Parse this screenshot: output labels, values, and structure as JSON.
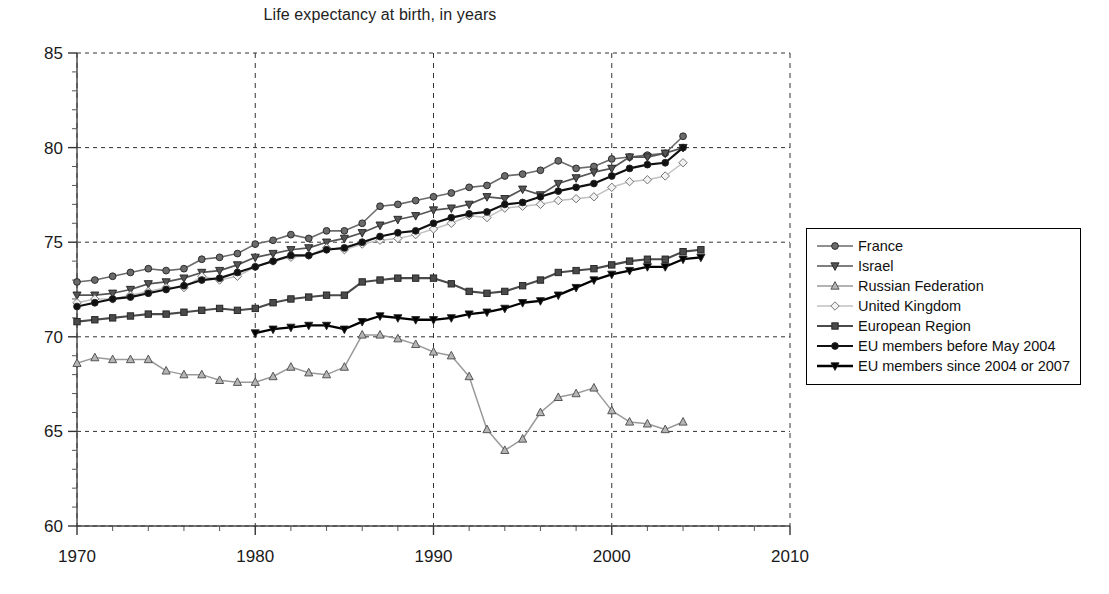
{
  "chart_data": {
    "type": "line",
    "title": "Life expectancy at birth, in years",
    "xlabel": "",
    "ylabel": "",
    "xlim": [
      1970,
      2010
    ],
    "ylim": [
      60,
      85
    ],
    "xticks": [
      1970,
      1980,
      1990,
      2000,
      2010
    ],
    "yticks": [
      60,
      65,
      70,
      75,
      80,
      85
    ],
    "x_minor_tick_step": 2,
    "y_minor_tick_step": 1,
    "grid": "dashed gridlines at major x and y ticks",
    "legend_position": "right, outside plot area, boxed",
    "series": [
      {
        "name": "France",
        "marker": "circle",
        "color": "#6b6b6b",
        "line_width": 1.6,
        "x": [
          1970,
          1971,
          1972,
          1973,
          1974,
          1975,
          1976,
          1977,
          1978,
          1979,
          1980,
          1981,
          1982,
          1983,
          1984,
          1985,
          1986,
          1987,
          1988,
          1989,
          1990,
          1991,
          1992,
          1993,
          1994,
          1995,
          1996,
          1997,
          1998,
          1999,
          2000,
          2001,
          2002,
          2003,
          2004
        ],
        "y": [
          72.9,
          73.0,
          73.2,
          73.4,
          73.6,
          73.5,
          73.6,
          74.1,
          74.2,
          74.4,
          74.9,
          75.1,
          75.4,
          75.2,
          75.6,
          75.6,
          76.0,
          76.9,
          77.0,
          77.2,
          77.4,
          77.6,
          77.9,
          78.0,
          78.5,
          78.6,
          78.8,
          79.3,
          78.9,
          79.0,
          79.4,
          79.5,
          79.6,
          79.7,
          80.6
        ]
      },
      {
        "name": "Israel",
        "marker": "triangle-down",
        "color": "#555555",
        "line_width": 1.7,
        "x": [
          1970,
          1971,
          1972,
          1973,
          1974,
          1975,
          1976,
          1977,
          1978,
          1979,
          1980,
          1981,
          1982,
          1983,
          1984,
          1985,
          1986,
          1987,
          1988,
          1989,
          1990,
          1991,
          1992,
          1993,
          1994,
          1995,
          1996,
          1997,
          1998,
          1999,
          2000,
          2001,
          2002,
          2003,
          2004
        ],
        "y": [
          72.2,
          72.2,
          72.3,
          72.5,
          72.8,
          72.9,
          73.1,
          73.4,
          73.5,
          73.8,
          74.2,
          74.4,
          74.6,
          74.7,
          75.0,
          75.2,
          75.5,
          75.9,
          76.2,
          76.4,
          76.7,
          76.8,
          77.0,
          77.4,
          77.3,
          77.8,
          77.5,
          78.1,
          78.4,
          78.7,
          78.9,
          79.5,
          79.5,
          79.7,
          80.0
        ]
      },
      {
        "name": "Russian Federation",
        "marker": "triangle-up",
        "color": "#9a9a9a",
        "line_width": 1.5,
        "x": [
          1970,
          1971,
          1972,
          1973,
          1974,
          1975,
          1976,
          1977,
          1978,
          1979,
          1980,
          1981,
          1982,
          1983,
          1984,
          1985,
          1986,
          1987,
          1988,
          1989,
          1990,
          1991,
          1992,
          1993,
          1994,
          1995,
          1996,
          1997,
          1998,
          1999,
          2000,
          2001,
          2002,
          2003,
          2004
        ],
        "y": [
          68.6,
          68.9,
          68.8,
          68.8,
          68.8,
          68.2,
          68.0,
          68.0,
          67.7,
          67.6,
          67.6,
          67.9,
          68.4,
          68.1,
          68.0,
          68.4,
          70.1,
          70.1,
          69.9,
          69.6,
          69.2,
          69.0,
          67.9,
          65.1,
          64.0,
          64.6,
          66.0,
          66.8,
          67.0,
          67.3,
          66.1,
          65.5,
          65.4,
          65.1,
          65.5
        ]
      },
      {
        "name": "United Kingdom",
        "marker": "diamond",
        "color": "#c0c0c0",
        "line_width": 1.5,
        "x": [
          1970,
          1971,
          1972,
          1973,
          1974,
          1975,
          1976,
          1977,
          1978,
          1979,
          1980,
          1981,
          1982,
          1983,
          1984,
          1985,
          1986,
          1987,
          1988,
          1989,
          1990,
          1991,
          1992,
          1993,
          1994,
          1995,
          1996,
          1997,
          1998,
          1999,
          2000,
          2001,
          2002,
          2003,
          2004
        ],
        "y": [
          71.8,
          72.0,
          72.0,
          72.2,
          72.4,
          72.6,
          72.6,
          73.2,
          73.0,
          73.2,
          73.7,
          74.0,
          74.2,
          74.3,
          74.7,
          74.6,
          74.9,
          75.1,
          75.2,
          75.4,
          75.7,
          76.0,
          76.4,
          76.3,
          76.8,
          76.9,
          77.0,
          77.2,
          77.3,
          77.4,
          77.9,
          78.2,
          78.3,
          78.5,
          79.2
        ]
      },
      {
        "name": "European Region",
        "marker": "square",
        "color": "#4a4a4a",
        "line_width": 2.1,
        "x": [
          1970,
          1971,
          1972,
          1973,
          1974,
          1975,
          1976,
          1977,
          1978,
          1979,
          1980,
          1981,
          1982,
          1983,
          1984,
          1985,
          1986,
          1987,
          1988,
          1989,
          1990,
          1991,
          1992,
          1993,
          1994,
          1995,
          1996,
          1997,
          1998,
          1999,
          2000,
          2001,
          2002,
          2003,
          2004,
          2005
        ],
        "y": [
          70.8,
          70.9,
          71.0,
          71.1,
          71.2,
          71.2,
          71.3,
          71.4,
          71.5,
          71.4,
          71.5,
          71.8,
          72.0,
          72.1,
          72.2,
          72.2,
          72.9,
          73.0,
          73.1,
          73.1,
          73.1,
          72.8,
          72.4,
          72.3,
          72.4,
          72.7,
          73.0,
          73.4,
          73.5,
          73.6,
          73.8,
          74.0,
          74.1,
          74.1,
          74.5,
          74.6
        ]
      },
      {
        "name": "EU members before May 2004",
        "marker": "circle",
        "color": "#111111",
        "line_width": 2.2,
        "x": [
          1970,
          1971,
          1972,
          1973,
          1974,
          1975,
          1976,
          1977,
          1978,
          1979,
          1980,
          1981,
          1982,
          1983,
          1984,
          1985,
          1986,
          1987,
          1988,
          1989,
          1990,
          1991,
          1992,
          1993,
          1994,
          1995,
          1996,
          1997,
          1998,
          1999,
          2000,
          2001,
          2002,
          2003,
          2004
        ],
        "y": [
          71.6,
          71.8,
          72.0,
          72.1,
          72.3,
          72.5,
          72.7,
          73.0,
          73.1,
          73.4,
          73.7,
          74.0,
          74.3,
          74.3,
          74.6,
          74.7,
          75.0,
          75.3,
          75.5,
          75.6,
          76.0,
          76.3,
          76.5,
          76.6,
          77.0,
          77.1,
          77.4,
          77.7,
          77.9,
          78.1,
          78.5,
          78.9,
          79.1,
          79.2,
          80.0
        ]
      },
      {
        "name": "EU members since 2004 or 2007",
        "marker": "triangle-down",
        "color": "#000000",
        "line_width": 2.3,
        "x": [
          1980,
          1981,
          1982,
          1983,
          1984,
          1985,
          1986,
          1987,
          1988,
          1989,
          1990,
          1991,
          1992,
          1993,
          1994,
          1995,
          1996,
          1997,
          1998,
          1999,
          2000,
          2001,
          2002,
          2003,
          2004,
          2005
        ],
        "y": [
          70.2,
          70.4,
          70.5,
          70.6,
          70.6,
          70.4,
          70.8,
          71.1,
          71.0,
          70.9,
          70.9,
          71.0,
          71.2,
          71.3,
          71.5,
          71.8,
          71.9,
          72.2,
          72.6,
          73.0,
          73.3,
          73.5,
          73.7,
          73.7,
          74.1,
          74.2
        ]
      }
    ]
  },
  "legend": {
    "items": [
      {
        "label": "France"
      },
      {
        "label": "Israel"
      },
      {
        "label": "Russian Federation"
      },
      {
        "label": "United Kingdom"
      },
      {
        "label": "European Region"
      },
      {
        "label": "EU members before May 2004"
      },
      {
        "label": "EU members since 2004 or 2007"
      }
    ]
  },
  "axes": {
    "x_tick_labels": [
      "1970",
      "1980",
      "1990",
      "2000",
      "2010"
    ],
    "y_tick_labels": [
      "60",
      "65",
      "70",
      "75",
      "80",
      "85"
    ]
  }
}
